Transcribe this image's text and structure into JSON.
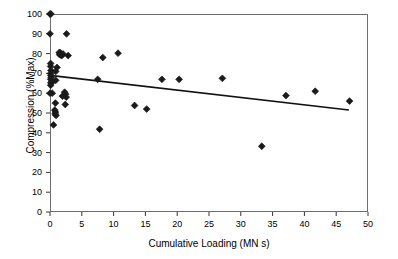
{
  "chart_data": {
    "type": "scatter",
    "title": "",
    "xlabel": "Cumulative Loading (MN s)",
    "ylabel": "Compression (%Max)",
    "xlim": [
      0,
      50
    ],
    "ylim": [
      0,
      100
    ],
    "xticks": [
      0,
      5,
      10,
      15,
      20,
      25,
      30,
      35,
      40,
      45,
      50
    ],
    "yticks": [
      0,
      10,
      20,
      30,
      40,
      50,
      60,
      70,
      80,
      90,
      100
    ],
    "xtick_labels": [
      "0",
      "5",
      "10",
      "15",
      "20",
      "25",
      "30",
      "35",
      "40",
      "45",
      "50"
    ],
    "ytick_labels": [
      "0",
      "10",
      "20",
      "30",
      "40",
      "50",
      "60",
      "70",
      "80",
      "90",
      "100"
    ],
    "grid": false,
    "legend": null,
    "marker": "filled-diamond",
    "marker_color": "#1a1a1a",
    "marker_size": 3.4,
    "series": [
      {
        "name": "Compression vs Cumulative Loading",
        "points": [
          [
            0.0,
            100.0
          ],
          [
            0.15,
            100.0
          ],
          [
            0.0,
            90.0
          ],
          [
            2.6,
            90.0
          ],
          [
            1.45,
            80.5
          ],
          [
            1.6,
            80.5
          ],
          [
            1.5,
            79.5
          ],
          [
            1.7,
            79.3
          ],
          [
            1.85,
            79.0
          ],
          [
            2.05,
            79.8
          ],
          [
            2.85,
            79.0
          ],
          [
            8.3,
            78.0
          ],
          [
            10.7,
            80.2
          ],
          [
            0.1,
            75.0
          ],
          [
            0.1,
            73.5
          ],
          [
            0.15,
            71.5
          ],
          [
            1.1,
            73.0
          ],
          [
            0.9,
            71.0
          ],
          [
            0.1,
            70.0
          ],
          [
            0.12,
            69.0
          ],
          [
            0.18,
            68.0
          ],
          [
            0.1,
            67.0
          ],
          [
            0.9,
            66.5
          ],
          [
            0.15,
            65.5
          ],
          [
            0.2,
            65.0
          ],
          [
            0.1,
            64.0
          ],
          [
            7.5,
            67.0
          ],
          [
            17.6,
            67.0
          ],
          [
            20.3,
            67.0
          ],
          [
            27.1,
            67.5
          ],
          [
            0.0,
            60.0
          ],
          [
            0.35,
            60.0
          ],
          [
            2.3,
            60.5
          ],
          [
            2.45,
            59.5
          ],
          [
            2.55,
            58.0
          ],
          [
            1.95,
            58.5
          ],
          [
            37.1,
            58.8
          ],
          [
            41.7,
            61.0
          ],
          [
            47.1,
            56.0
          ],
          [
            0.85,
            55.0
          ],
          [
            2.4,
            54.3
          ],
          [
            13.3,
            53.8
          ],
          [
            15.2,
            52.0
          ],
          [
            0.75,
            51.5
          ],
          [
            0.85,
            50.5
          ],
          [
            0.8,
            49.5
          ],
          [
            0.95,
            48.8
          ],
          [
            0.55,
            44.0
          ],
          [
            7.8,
            41.8
          ],
          [
            33.3,
            33.2
          ]
        ]
      }
    ],
    "trendline": {
      "type": "linear-fit",
      "x_start": 0.0,
      "y_start": 69.0,
      "x_end": 47.0,
      "y_end": 51.5,
      "color": "#111111",
      "width": 1.6
    }
  },
  "axes": {
    "frame_color": "#6e6e6e",
    "tick_color": "#333333"
  }
}
